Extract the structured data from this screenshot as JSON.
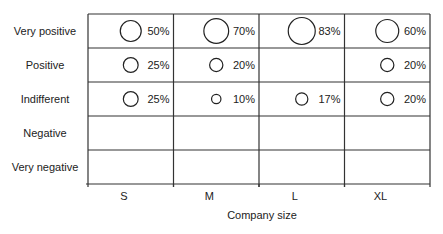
{
  "chart_data": {
    "type": "bubble-grid",
    "title": "",
    "xlabel": "Company size",
    "ylabel": "",
    "categories": [
      "S",
      "M",
      "L",
      "XL"
    ],
    "rows": [
      "Very positive",
      "Positive",
      "Indifferent",
      "Negative",
      "Very negative"
    ],
    "series": [
      {
        "name": "Very positive",
        "values": [
          50,
          70,
          83,
          60
        ]
      },
      {
        "name": "Positive",
        "values": [
          25,
          20,
          null,
          20
        ]
      },
      {
        "name": "Indifferent",
        "values": [
          25,
          10,
          17,
          20
        ]
      },
      {
        "name": "Negative",
        "values": [
          null,
          null,
          null,
          null
        ]
      },
      {
        "name": "Very negative",
        "values": [
          null,
          null,
          null,
          null
        ]
      }
    ],
    "unit": "%",
    "grid": true,
    "legend": "none"
  }
}
